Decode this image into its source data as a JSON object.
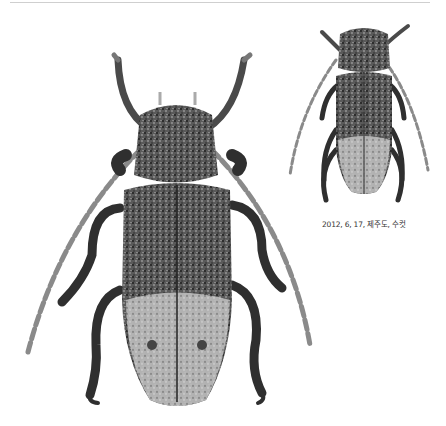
{
  "figure": {
    "specimens": [
      {
        "id": "large",
        "view": "dorsal"
      },
      {
        "id": "small",
        "view": "dorsal"
      }
    ],
    "caption": "2012, 6, 17, 제주도, 수컷"
  },
  "colors": {
    "background": "#ffffff",
    "body_dark": "#2a2a2a",
    "body_mid": "#6e6e6e",
    "body_light": "#bdbdbd",
    "caption_text": "#333333",
    "top_rule": "#cfcfcf"
  }
}
